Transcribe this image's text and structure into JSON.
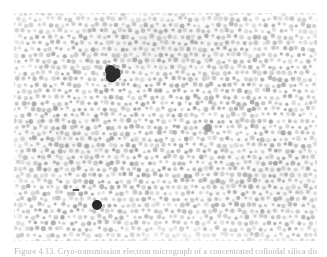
{
  "figure": {
    "caption_label": "Figure 4.13.",
    "caption_text": "Cryo-transmission electron micrograph of a concentrated colloidal silica dispersion.",
    "caption_full": "Figure 4.13. Cryo-transmission electron micrograph of a concentrated colloidal silica dispersion.",
    "plate": {
      "alt": "Dense two-dimensional array of monodisperse spherical particles with a few dark defects",
      "background_color": "#fdfdfd",
      "particle_color": "#c3c3c3",
      "defect_color": "#2b2b2b"
    }
  },
  "chart_data": {
    "type": "scatter",
    "title": "Figure 4.13.",
    "xlabel": "",
    "ylabel": "",
    "xlim": [
      0,
      303
    ],
    "ylim": [
      0,
      228
    ],
    "grid": false,
    "legend": null,
    "lattice": {
      "rows": 38,
      "columns": 51,
      "spacing_x": 6.0,
      "spacing_y": 6.0,
      "row_offset_x": 3.0,
      "jitter": 1.35,
      "particle_radius_mean": 2.0,
      "particle_radius_jitter": 0.55,
      "particle_gray_mean": 196,
      "particle_gray_jitter": 26,
      "count_estimate": 1900
    },
    "defects": [
      {
        "name": "dark-aggregate-cluster",
        "x": 99,
        "y": 60,
        "radius": 6.5,
        "shape": "irregular",
        "gray": 40
      },
      {
        "name": "dark-round-particle",
        "x": 83,
        "y": 192,
        "radius": 5.0,
        "shape": "circle",
        "gray": 30
      },
      {
        "name": "dark-dash-mark",
        "x": 62,
        "y": 177,
        "radius": 2.0,
        "shape": "dash",
        "gray": 70
      },
      {
        "name": "faint-large-particle",
        "x": 194,
        "y": 115,
        "radius": 4.0,
        "shape": "circle",
        "gray": 160
      }
    ],
    "shading_bands": [
      {
        "name": "upper-dark-band",
        "cx_pct": 48,
        "cy_pct": 14,
        "rx": 150,
        "ry": 55,
        "alpha": 0.085
      },
      {
        "name": "left-mid-band",
        "cx_pct": 18,
        "cy_pct": 58,
        "rx": 120,
        "ry": 60,
        "alpha": 0.05
      },
      {
        "name": "lower-right-band",
        "cx_pct": 85,
        "cy_pct": 72,
        "rx": 130,
        "ry": 70,
        "alpha": 0.05
      }
    ]
  }
}
